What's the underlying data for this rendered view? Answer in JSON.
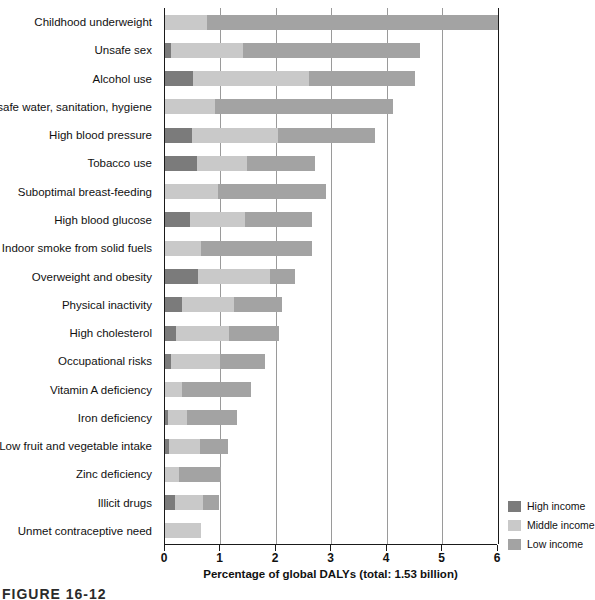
{
  "chart_data": {
    "type": "bar",
    "orientation": "horizontal",
    "stacked": true,
    "title": "",
    "xlabel": "Percentage of global DALYs (total: 1.53 billion)",
    "ylabel": "",
    "xlim": [
      0,
      6
    ],
    "xticks": [
      0,
      1,
      2,
      3,
      4,
      5,
      6
    ],
    "xticklabels": [
      "0",
      "1",
      "2",
      "3",
      "4",
      "5",
      "6"
    ],
    "grid": "vertical",
    "legend_position": "right-bottom",
    "legend": [
      "High income",
      "Middle income",
      "Low income"
    ],
    "colors": {
      "high_income": "#7b7b7b",
      "middle_income": "#c9c9c9",
      "low_income": "#a3a3a3",
      "axis": "#1a1a1a",
      "gridline": "#9a9a9a"
    },
    "series": [
      {
        "name": "High income",
        "key": "high",
        "values": [
          0.0,
          0.1,
          0.5,
          0.0,
          0.48,
          0.58,
          0.0,
          0.45,
          0.0,
          0.6,
          0.3,
          0.2,
          0.1,
          0.0,
          0.05,
          0.08,
          0.0,
          0.18,
          0.0
        ]
      },
      {
        "name": "Middle income",
        "key": "mid",
        "values": [
          0.75,
          1.3,
          2.1,
          0.9,
          1.55,
          0.9,
          0.95,
          1.0,
          0.65,
          1.3,
          0.95,
          0.95,
          0.9,
          0.3,
          0.35,
          0.55,
          0.25,
          0.5,
          0.65
        ]
      },
      {
        "name": "Low income",
        "key": "low",
        "values": [
          5.25,
          3.2,
          1.9,
          3.2,
          1.75,
          1.22,
          1.95,
          1.2,
          2.0,
          0.45,
          0.85,
          0.9,
          0.8,
          1.25,
          0.9,
          0.5,
          0.75,
          0.3,
          0.0
        ]
      }
    ],
    "categories": [
      "Childhood underweight",
      "Unsafe sex",
      "Alcohol use",
      "Unsafe water, sanitation, hygiene",
      "High blood pressure",
      "Tobacco use",
      "Suboptimal breast-feeding",
      "High blood glucose",
      "Indoor smoke from solid fuels",
      "Overweight and obesity",
      "Physical inactivity",
      "High cholesterol",
      "Occupational risks",
      "Vitamin A deficiency",
      "Iron deficiency",
      "Low fruit and vegetable intake",
      "Zinc deficiency",
      "Illicit drugs",
      "Unmet contraceptive need"
    ],
    "totals": [
      6.0,
      4.6,
      4.5,
      4.1,
      3.78,
      2.7,
      2.9,
      2.65,
      2.65,
      2.35,
      2.1,
      2.05,
      1.8,
      1.55,
      1.3,
      1.13,
      1.0,
      0.98,
      0.65
    ]
  },
  "legend": {
    "items": [
      {
        "label": "High income",
        "color": "#7b7b7b",
        "cls": "high"
      },
      {
        "label": "Middle income",
        "color": "#c9c9c9",
        "cls": "mid"
      },
      {
        "label": "Low income",
        "color": "#a3a3a3",
        "cls": "low"
      }
    ]
  },
  "caption": "FIGURE 16-12"
}
